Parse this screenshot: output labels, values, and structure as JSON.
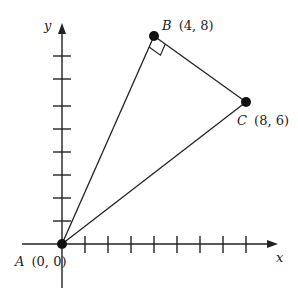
{
  "diagram": {
    "type": "coordinate-geometry",
    "axes": {
      "x_label": "x",
      "y_label": "y",
      "x_ticks": [
        1,
        2,
        3,
        4,
        5,
        6,
        7,
        8
      ],
      "y_ticks": [
        1,
        2,
        3,
        4,
        5,
        6,
        7,
        8
      ]
    },
    "points": [
      {
        "id": "A",
        "name": "A",
        "coords": "(0, 0)",
        "x": 0,
        "y": 0
      },
      {
        "id": "B",
        "name": "B",
        "coords": "(4, 8)",
        "x": 4,
        "y": 8
      },
      {
        "id": "C",
        "name": "C",
        "coords": "(8, 6)",
        "x": 8,
        "y": 6
      }
    ],
    "segments": [
      [
        "A",
        "B"
      ],
      [
        "B",
        "C"
      ],
      [
        "A",
        "C"
      ]
    ],
    "right_angle_at": "B",
    "colors": {
      "stroke": "#222222",
      "background": "#ffffff"
    }
  }
}
